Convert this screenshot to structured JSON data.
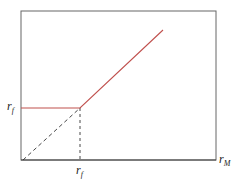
{
  "diagram": {
    "y_label": "r",
    "y_label_sub": "f",
    "x_tick_label": "r",
    "x_tick_label_sub": "f",
    "x_axis_label": "r",
    "x_axis_label_sub": "M",
    "line_color": "#c0504d",
    "axis_color": "#555555"
  }
}
